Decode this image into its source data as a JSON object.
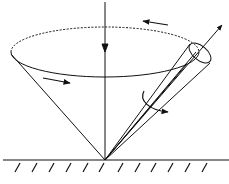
{
  "diagram": {
    "colors": {
      "stroke": "#111111",
      "background": "#ffffff"
    },
    "elements": {
      "vertical_axis": "gravity / vertical axis with downward arrow",
      "precession_circle": "dashed ellipse traced by top of spin axis",
      "precession_arrows": [
        "arrow along back of ellipse pointing left",
        "arrow along front of cone pointing right"
      ],
      "spin_axis": "tilted axis with outward arrow",
      "top_body": "narrow cylinder/cone representing spinning top",
      "spin_arrow": "curved arrow around spin axis",
      "ground": "hatched ground surface"
    }
  }
}
